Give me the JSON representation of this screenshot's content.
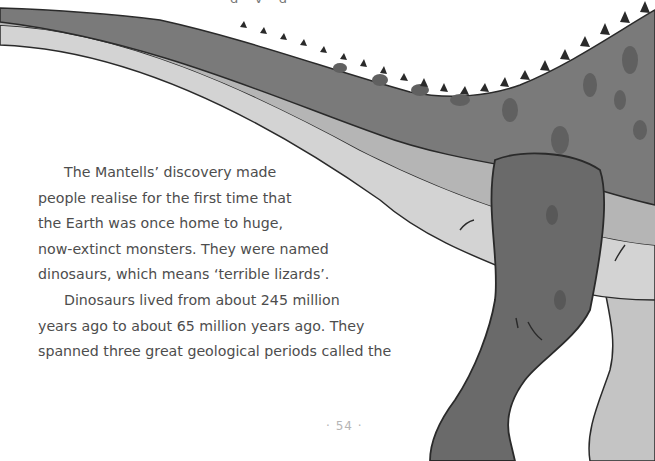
{
  "page": {
    "top_fragment": "g · y · g ·",
    "paragraphs": [
      {
        "indent": true,
        "lines": [
          "The Mantells’ discovery made",
          "people realise for the first time that",
          "the Earth was once home to huge,",
          "now-extinct monsters. They were named",
          "dinosaurs, which means ‘terrible lizards’."
        ]
      },
      {
        "indent": true,
        "lines": [
          "Dinosaurs lived from about 245 million",
          "years ago to about 65 million years ago. They",
          "spanned three great geological periods called the"
        ]
      }
    ],
    "page_number": "· 54 ·"
  },
  "illustration": {
    "subject": "dinosaur-tail-and-leg",
    "colors": {
      "body_dark": "#6e6e6e",
      "body_mid": "#8c8c8c",
      "belly_light": "#b9b9b9",
      "underside": "#d2d2d2",
      "spots": "#5e5e5e",
      "outline": "#2a2a2a"
    }
  }
}
